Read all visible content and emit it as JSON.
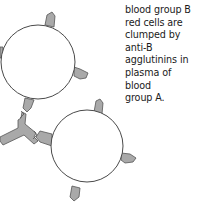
{
  "figure": {
    "caption": "blood group B red cells are clumped by anti-B agglutinins in plasma of blood group A.",
    "caption_lines": [
      "blood group B",
      "red cells are",
      "clumped by",
      "anti-B",
      "agglutinins in",
      "plasma of blood",
      "group A."
    ],
    "elements": {
      "red_cell_1": "red blood cell (group B)",
      "red_cell_2": "red blood cell (group B)",
      "antibody": "anti-B agglutinin"
    },
    "colors": {
      "cell_fill": "#ffffff",
      "cell_stroke": "#4a4a4a",
      "antigen_fill": "#a9a9a9",
      "antibody_fill": "#a9a9a9"
    }
  }
}
